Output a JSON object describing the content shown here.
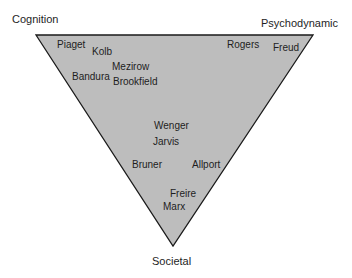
{
  "diagram": {
    "type": "inverted-triangle",
    "fill_color": "#bdbdbd",
    "stroke_color": "#1a1a1a",
    "corners": {
      "top_left": "Cognition",
      "top_right": "Psychodynamic",
      "bottom": "Societal"
    },
    "theorists": [
      {
        "name": "Piaget",
        "x": 57,
        "y": 40
      },
      {
        "name": "Kolb",
        "x": 92,
        "y": 47
      },
      {
        "name": "Mezirow",
        "x": 112,
        "y": 62
      },
      {
        "name": "Bandura",
        "x": 72,
        "y": 72
      },
      {
        "name": "Brookfield",
        "x": 113,
        "y": 77
      },
      {
        "name": "Rogers",
        "x": 227,
        "y": 40
      },
      {
        "name": "Freud",
        "x": 273,
        "y": 43
      },
      {
        "name": "Wenger",
        "x": 154,
        "y": 121
      },
      {
        "name": "Jarvis",
        "x": 153,
        "y": 137
      },
      {
        "name": "Bruner",
        "x": 132,
        "y": 160
      },
      {
        "name": "Allport",
        "x": 192,
        "y": 160
      },
      {
        "name": "Freire",
        "x": 170,
        "y": 189
      },
      {
        "name": "Marx",
        "x": 163,
        "y": 202
      }
    ]
  }
}
